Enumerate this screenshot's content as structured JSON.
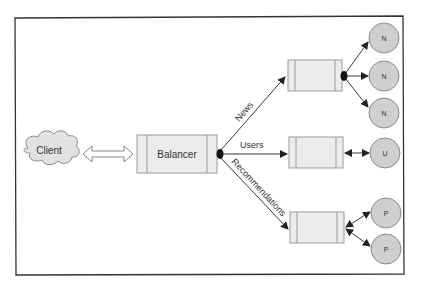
{
  "diagram": {
    "client": {
      "label": "Client"
    },
    "balancer": {
      "label": "Balancer"
    },
    "routes": [
      {
        "label": "News",
        "nodes": [
          "N",
          "N",
          "N"
        ]
      },
      {
        "label": "Users",
        "nodes": [
          "U"
        ]
      },
      {
        "label": "Recommendations",
        "nodes": [
          "P",
          "P"
        ]
      }
    ]
  },
  "colors": {
    "border": "#333333",
    "box_fill": "#ececec",
    "box_stroke": "#9a9a9a",
    "node_fill": "#cfcfcf",
    "node_stroke": "#8a8a8a",
    "cloud_fill": "#e2e2e2",
    "arrow": "#222222"
  }
}
